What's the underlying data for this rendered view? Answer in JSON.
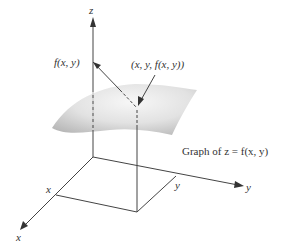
{
  "diagram": {
    "type": "3d-surface-graph",
    "axes": {
      "z_label": "z",
      "x_label": "x",
      "y_label": "y"
    },
    "markers": {
      "x_tick_label": "x",
      "y_tick_label": "y",
      "height_label": "f(x, y)",
      "point_label": "(x, y, f(x, y))"
    },
    "caption": "Graph of z = f(x, y)",
    "colors": {
      "line": "#444444",
      "surface_light": "#f2f2f2",
      "surface_dark": "#bdbdbd",
      "text": "#333333"
    }
  }
}
